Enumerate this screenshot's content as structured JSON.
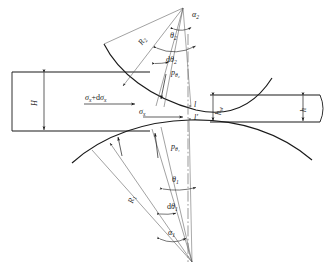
{
  "figure": {
    "type": "engineering-diagram",
    "background_color": "#ffffff",
    "line_color": "#1a1a1a",
    "thin_line_color": "#555555"
  },
  "labels": {
    "alpha2": "α",
    "alpha2_sub": "2",
    "theta2": "θ",
    "theta2_sub": "2",
    "dtheta2_d": "d",
    "dtheta2": "θ",
    "dtheta2_sub": "2",
    "ptheta2": "p",
    "ptheta2_sub": "θ₂",
    "R2": "R",
    "R2_sub": "2",
    "R1": "R",
    "R1_sub": "1",
    "H": "H",
    "h": "h",
    "hw": "h",
    "hw_sub": "w",
    "sigma_x": "σ",
    "sigma_x_sub": "x",
    "sigma_x_dsigma_x": "σ",
    "sigma_x_dsigma_x_sub": "x",
    "sigma_x_dsigma_x_plus": "+d",
    "sigma_x_dsigma_x_sub2": "x",
    "point_l": "l",
    "point_l_prime": "l′",
    "ptheta1": "p",
    "ptheta1_sub": "θ₁",
    "theta1": "θ",
    "theta1_sub": "1",
    "dtheta1_d": "d",
    "dtheta1": "θ",
    "dtheta1_sub": "1",
    "alpha1": "α",
    "alpha1_sub": "1"
  },
  "geometry": {
    "centerline_x": 188,
    "apex_x": 183,
    "apex_y": 8,
    "slab_left_top_y": 72,
    "slab_left_bottom_y": 131,
    "slab_right_top_y": 95,
    "slab_right_bottom_y": 122,
    "upper_roll_center_y": 110,
    "lower_roll_center_y": 120
  }
}
